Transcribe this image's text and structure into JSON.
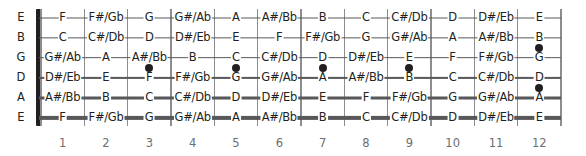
{
  "diagram": {
    "type": "fretboard",
    "fret_count": 12,
    "string_count": 6,
    "colors": {
      "background": "#ffffff",
      "note_text": "#231f20",
      "fret_line": "#8d8d8f",
      "string_line": "#58585b",
      "nut": "#231f20",
      "inlay_dot": "#231f20",
      "fret_number": "#6d6e71"
    }
  },
  "open_strings": [
    {
      "label": "E",
      "name": "high-e-string"
    },
    {
      "label": "B",
      "name": "b-string"
    },
    {
      "label": "G",
      "name": "g-string"
    },
    {
      "label": "D",
      "name": "d-string"
    },
    {
      "label": "A",
      "name": "a-string"
    },
    {
      "label": "E",
      "name": "low-e-string"
    }
  ],
  "fret_numbers": [
    "1",
    "2",
    "3",
    "4",
    "5",
    "6",
    "7",
    "8",
    "9",
    "10",
    "11",
    "12"
  ],
  "strings": [
    {
      "open": "E",
      "notes": [
        "F",
        "F#/Gb",
        "G",
        "G#/Ab",
        "A",
        "A#/Bb",
        "B",
        "C",
        "C#/Db",
        "D",
        "D#/Eb",
        "E"
      ]
    },
    {
      "open": "B",
      "notes": [
        "C",
        "C#/Db",
        "D",
        "D#/Eb",
        "E",
        "F",
        "F#/Gb",
        "G",
        "G#/Ab",
        "A",
        "A#/Bb",
        "B"
      ]
    },
    {
      "open": "G",
      "notes": [
        "G#/Ab",
        "A",
        "A#/Bb",
        "B",
        "C",
        "C#/Db",
        "D",
        "D#/Eb",
        "E",
        "F",
        "F#/Gb",
        "G"
      ]
    },
    {
      "open": "D",
      "notes": [
        "D#/Eb",
        "E",
        "F",
        "F#/Gb",
        "G",
        "G#/Ab",
        "A",
        "A#/Bb",
        "B",
        "C",
        "C#/Db",
        "D"
      ]
    },
    {
      "open": "A",
      "notes": [
        "A#/Bb",
        "B",
        "C",
        "C#/Db",
        "D",
        "D#/Eb",
        "E",
        "F",
        "F#/Gb",
        "G",
        "G#/Ab",
        "A"
      ]
    },
    {
      "open": "E",
      "notes": [
        "F",
        "F#/Gb",
        "G",
        "G#/Ab",
        "A",
        "A#/Bb",
        "B",
        "C",
        "C#/Db",
        "D",
        "D#/Eb",
        "E"
      ]
    }
  ],
  "inlays": [
    {
      "fret": 3,
      "between_strings": "G-D",
      "double": false
    },
    {
      "fret": 5,
      "between_strings": "G-D",
      "double": false
    },
    {
      "fret": 7,
      "between_strings": "G-D",
      "double": false
    },
    {
      "fret": 9,
      "between_strings": "G-D",
      "double": false
    },
    {
      "fret": 12,
      "between_strings": "B-G",
      "double": true
    },
    {
      "fret": 12,
      "between_strings": "D-A",
      "double": true
    }
  ]
}
